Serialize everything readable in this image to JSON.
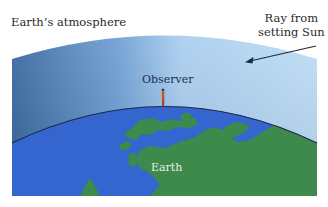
{
  "figure": {
    "labels": {
      "atmosphere": "Earth’s atmosphere",
      "ray_line1": "Ray from",
      "ray_line2": "setting Sun",
      "observer": "Observer",
      "earth": "Earth"
    },
    "colors": {
      "atmosphere_dark": "#3f6fa6",
      "atmosphere_light": "#b9d9f3",
      "ocean": "#3565cf",
      "land": "#3d8a4c",
      "horizon_line": "#1b2a45",
      "observer": "#c0522a",
      "arrow": "#1b2a45"
    }
  }
}
